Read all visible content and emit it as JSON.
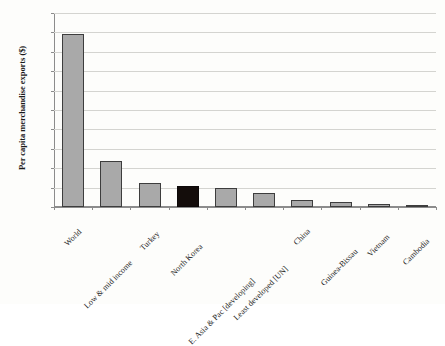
{
  "chart_data": {
    "type": "bar",
    "title": "",
    "xlabel": "",
    "ylabel": "Per capita merchandise exports ($)",
    "ylim": [
      0,
      500
    ],
    "yticks": [
      0,
      50,
      100,
      150,
      200,
      250,
      300,
      350,
      400,
      450,
      500
    ],
    "grid": true,
    "legend": "none",
    "orientation": "vertical",
    "categories": [
      "World",
      "Low & mid income",
      "Turkey",
      "North Korea",
      "E. Asia & Pac [developing]",
      "Least developed [UN]",
      "China",
      "Guinea-Bissau",
      "Vietnam",
      "Cambodia"
    ],
    "values": [
      445,
      118,
      62,
      53,
      48,
      37,
      18,
      13,
      8,
      4
    ],
    "bar_colors": [
      "#a9a9a9",
      "#a9a9a9",
      "#a9a9a9",
      "#140d0b",
      "#a9a9a9",
      "#a9a9a9",
      "#a9a9a9",
      "#a9a9a9",
      "#a9a9a9",
      "#a9a9a9"
    ],
    "highlight_category": "North Korea",
    "bar_edge_color": "#3d3d3d",
    "grid_color": "#d4d4d0",
    "axis_color": "#8c8c8c",
    "background": "#fdfdfb"
  }
}
